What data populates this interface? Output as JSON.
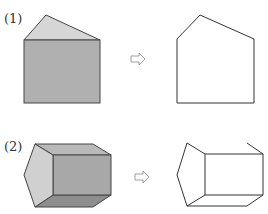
{
  "problems": [
    {
      "label": "(1)",
      "solid": "pentagonal-prism-front-view",
      "result": "pentagon-outline"
    },
    {
      "label": "(2)",
      "solid": "pentagonal-prism-oblique",
      "result": "partial-oblique-outline"
    }
  ],
  "arrow_glyph": "⇨",
  "colors": {
    "face_light": "#d6d6d6",
    "face_mid": "#b5b5b5",
    "face_dark": "#a3a3a3",
    "stroke": "#444444"
  }
}
